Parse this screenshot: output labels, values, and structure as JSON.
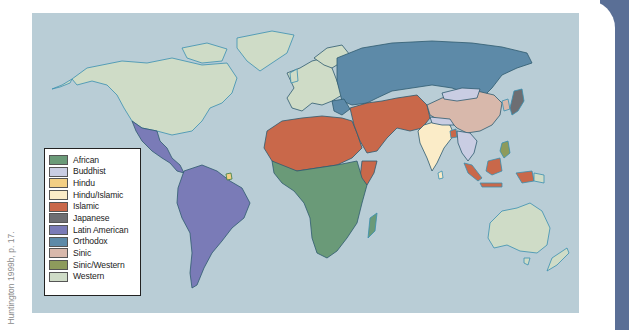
{
  "figure": {
    "credit": "Huntington 1999b, p. 17.",
    "ocean_color": "#b9cdd6",
    "tab_color": "#5a6f96"
  },
  "legend": {
    "items": [
      {
        "label": "African",
        "color": "#6a9a78"
      },
      {
        "label": "Buddhist",
        "color": "#c9cde3"
      },
      {
        "label": "Hindu",
        "color": "#f3cf84"
      },
      {
        "label": "Hindu/Islamic",
        "color": "#fbecc8"
      },
      {
        "label": "Islamic",
        "color": "#c9684a"
      },
      {
        "label": "Japanese",
        "color": "#6d6e72"
      },
      {
        "label": "Latin American",
        "color": "#7a7bb7"
      },
      {
        "label": "Orthodox",
        "color": "#5d8aa8"
      },
      {
        "label": "Sinic",
        "color": "#d8b8ab"
      },
      {
        "label": "Sinic/Western",
        "color": "#8d9b5c"
      },
      {
        "label": "Western",
        "color": "#cfdcc7"
      }
    ]
  },
  "regions": {
    "western": "#cfdcc7",
    "latin_american": "#7a7bb7",
    "african": "#6a9a78",
    "islamic": "#c9684a",
    "orthodox": "#5d8aa8",
    "sinic": "#d8b8ab",
    "buddhist": "#c9cde3",
    "hindu_islamic": "#fbecc8",
    "japanese": "#6d6e72",
    "border": "#2f5a6e",
    "coast": "#3a8fb0"
  }
}
